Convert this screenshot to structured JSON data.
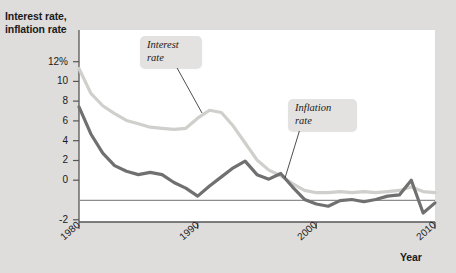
{
  "figure": {
    "background_color": "#dedddb",
    "plot_background_color": "#ffffff"
  },
  "axes": {
    "y_title_line1": "Interest rate,",
    "y_title_line2": "inflation rate",
    "x_title": "Year",
    "y_ticks": [
      "12%",
      "10",
      "8",
      "6",
      "4",
      "2",
      "0",
      "-2"
    ],
    "x_ticks": [
      "1980",
      "1990",
      "2000",
      "2010"
    ]
  },
  "callouts": {
    "interest_line1": "Interest",
    "interest_line2": "rate",
    "inflation_line1": "Inflation",
    "inflation_line2": "rate"
  },
  "chart_data": {
    "type": "line",
    "title": "",
    "subtitle": "",
    "xlabel": "Year",
    "ylabel": "Interest rate, inflation rate",
    "xlim": [
      1980,
      2010
    ],
    "ylim": [
      -2,
      12
    ],
    "ytick_values": [
      12,
      10,
      8,
      6,
      4,
      2,
      0,
      -2
    ],
    "ytick_labels": [
      "12%",
      "10",
      "8",
      "6",
      "4",
      "2",
      "0",
      "-2"
    ],
    "xtick_values": [
      1980,
      1990,
      2000,
      2010
    ],
    "xtick_labels": [
      "1980",
      "1990",
      "2000",
      "2010"
    ],
    "grid": false,
    "zero_line": true,
    "legend": "callout-annotations",
    "x": [
      1980,
      1981,
      1982,
      1983,
      1984,
      1985,
      1986,
      1987,
      1988,
      1989,
      1990,
      1991,
      1992,
      1993,
      1994,
      1995,
      1996,
      1997,
      1998,
      1999,
      2000,
      2001,
      2002,
      2003,
      2004,
      2005,
      2006,
      2007,
      2008,
      2009,
      2010
    ],
    "series": [
      {
        "name": "Interest rate",
        "color": "#cfcfcc",
        "values": [
          11.4,
          9.2,
          8.1,
          7.4,
          6.8,
          6.5,
          6.2,
          6.1,
          6.0,
          6.1,
          7.0,
          7.7,
          7.5,
          6.3,
          4.8,
          3.3,
          2.4,
          1.9,
          1.2,
          0.6,
          0.4,
          0.4,
          0.5,
          0.4,
          0.5,
          0.4,
          0.5,
          0.6,
          0.9,
          0.5,
          0.4
        ]
      },
      {
        "name": "Inflation rate",
        "color": "#707070",
        "values": [
          8.0,
          5.6,
          3.9,
          2.8,
          2.3,
          2.0,
          2.2,
          2.0,
          1.3,
          0.8,
          0.1,
          1.0,
          1.8,
          2.6,
          3.2,
          2.0,
          1.6,
          2.1,
          0.9,
          -0.2,
          -0.6,
          -0.8,
          -0.3,
          -0.2,
          -0.4,
          -0.2,
          0.1,
          0.2,
          1.5,
          -1.4,
          -0.5
        ]
      }
    ],
    "annotations": [
      {
        "text": "Interest rate",
        "target_x": 1991,
        "target_y": 7.4
      },
      {
        "text": "Inflation rate",
        "target_x": 1997,
        "target_y": 2.1
      }
    ]
  }
}
